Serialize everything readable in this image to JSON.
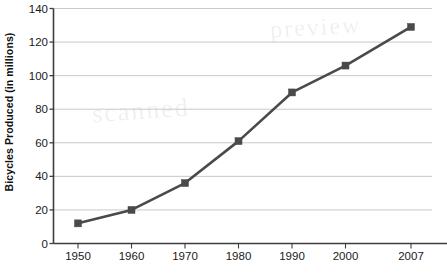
{
  "chart_data": {
    "type": "line",
    "title": "",
    "xlabel": "",
    "ylabel": "Bicycles Produced (in millions)",
    "categories": [
      "1950",
      "1960",
      "1970",
      "1980",
      "1990",
      "2000",
      "2007"
    ],
    "x": [
      1950,
      1960,
      1970,
      1980,
      1990,
      2000,
      2007
    ],
    "values": [
      12,
      20,
      36,
      61,
      90,
      106,
      129
    ],
    "series": [
      {
        "name": "Bicycles Produced",
        "values": [
          12,
          20,
          36,
          61,
          90,
          106,
          129
        ]
      }
    ],
    "ylim": [
      0,
      140
    ],
    "y_ticks": [
      0,
      20,
      40,
      60,
      80,
      100,
      120,
      140
    ],
    "y_tick_labels": [
      "0",
      "20",
      "40",
      "60",
      "80",
      "100",
      "120",
      "140"
    ],
    "x_tick_labels": [
      "1950",
      "1960",
      "1970",
      "1980",
      "1990",
      "2000",
      "2007"
    ],
    "grid": "horizontal",
    "legend": "none",
    "marker": "square",
    "line_color": "#4a4a4a",
    "marker_color": "#4a4a4a",
    "grid_color": "#c9c9c9",
    "axis_color": "#3d3d3d",
    "background": "#ffffff"
  },
  "axis": {
    "y_title": "Bicycles Produced (in millions)"
  },
  "watermarks": [
    {
      "text": "scanned",
      "x": 92,
      "y": 96,
      "rotate": -4,
      "size": 26
    },
    {
      "text": "preview",
      "x": 270,
      "y": 14,
      "rotate": -3,
      "size": 24
    }
  ]
}
